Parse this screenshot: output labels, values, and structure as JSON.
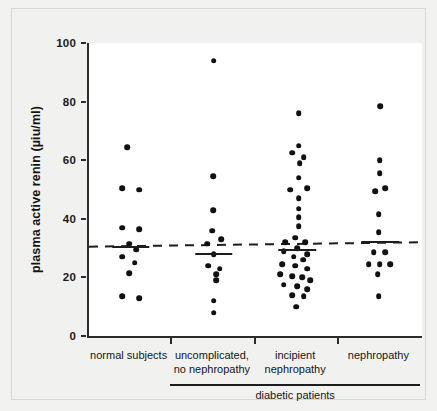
{
  "chart_data": {
    "type": "scatter",
    "title": "",
    "xlabel": "diabetic patients",
    "ylabel": "plasma active renin (µiu/ml)",
    "ylim": [
      0,
      100
    ],
    "yticks": [
      0,
      20,
      40,
      60,
      80,
      100
    ],
    "ytick_labels": [
      "0",
      "20",
      "40",
      "60",
      "80",
      "100"
    ],
    "grid": false,
    "legend": false,
    "categories": [
      "normal subjects",
      "uncomplicated,\nno nephropathy",
      "incipient\nnephropathy",
      "nephropathy"
    ],
    "group_bracket_label": "diabetic patients",
    "group_bracket_categories": [
      "uncomplicated, no nephropathy",
      "incipient nephropathy",
      "nephropathy"
    ],
    "reference_line": {
      "style": "dashed",
      "y_left": 30.5,
      "y_right": 32.0,
      "color": "#1d1d1d"
    },
    "series": [
      {
        "name": "normal subjects",
        "median": 30.5,
        "points": [
          {
            "value": 64.5,
            "offset": -0.04
          },
          {
            "value": 50.5,
            "offset": -0.1
          },
          {
            "value": 50.0,
            "offset": 0.1
          },
          {
            "value": 37.0,
            "offset": -0.1
          },
          {
            "value": 36.5,
            "offset": 0.1
          },
          {
            "value": 31.5,
            "offset": -0.02
          },
          {
            "value": 29.5,
            "offset": 0.07
          },
          {
            "value": 27.0,
            "offset": -0.1
          },
          {
            "value": 25.0,
            "offset": 0.05
          },
          {
            "value": 21.5,
            "offset": -0.02
          },
          {
            "value": 13.5,
            "offset": -0.1
          },
          {
            "value": 13.0,
            "offset": 0.1
          }
        ]
      },
      {
        "name": "uncomplicated, no nephropathy",
        "median": 28.0,
        "points": [
          {
            "value": 94.0,
            "offset": 0.0
          },
          {
            "value": 54.5,
            "offset": -0.01
          },
          {
            "value": 43.0,
            "offset": -0.01
          },
          {
            "value": 36.0,
            "offset": -0.02
          },
          {
            "value": 33.0,
            "offset": 0.09
          },
          {
            "value": 31.5,
            "offset": -0.08
          },
          {
            "value": 28.0,
            "offset": 0.0
          },
          {
            "value": 24.0,
            "offset": -0.07
          },
          {
            "value": 23.0,
            "offset": 0.07
          },
          {
            "value": 21.0,
            "offset": 0.03
          },
          {
            "value": 19.0,
            "offset": 0.03
          },
          {
            "value": 12.0,
            "offset": 0.0
          },
          {
            "value": 8.0,
            "offset": 0.0
          }
        ]
      },
      {
        "name": "incipient nephropathy",
        "median": 29.5,
        "points": [
          {
            "value": 76.0,
            "offset": 0.02
          },
          {
            "value": 65.0,
            "offset": 0.02
          },
          {
            "value": 62.5,
            "offset": -0.06
          },
          {
            "value": 61.0,
            "offset": 0.08
          },
          {
            "value": 59.0,
            "offset": 0.03
          },
          {
            "value": 54.0,
            "offset": 0.02
          },
          {
            "value": 50.0,
            "offset": -0.08
          },
          {
            "value": 50.5,
            "offset": 0.12
          },
          {
            "value": 47.0,
            "offset": 0.02
          },
          {
            "value": 43.5,
            "offset": 0.02
          },
          {
            "value": 40.5,
            "offset": 0.02
          },
          {
            "value": 37.5,
            "offset": 0.02
          },
          {
            "value": 33.5,
            "offset": -0.02
          },
          {
            "value": 32.0,
            "offset": -0.14
          },
          {
            "value": 32.0,
            "offset": 0.1
          },
          {
            "value": 30.0,
            "offset": 0.0
          },
          {
            "value": 29.0,
            "offset": -0.16
          },
          {
            "value": 28.0,
            "offset": 0.12
          },
          {
            "value": 27.0,
            "offset": -0.04
          },
          {
            "value": 26.0,
            "offset": 0.07
          },
          {
            "value": 24.5,
            "offset": -0.18
          },
          {
            "value": 24.0,
            "offset": -0.02
          },
          {
            "value": 23.0,
            "offset": 0.12
          },
          {
            "value": 21.0,
            "offset": -0.2
          },
          {
            "value": 20.5,
            "offset": -0.06
          },
          {
            "value": 20.0,
            "offset": 0.06
          },
          {
            "value": 19.0,
            "offset": 0.16
          },
          {
            "value": 17.5,
            "offset": -0.16
          },
          {
            "value": 17.0,
            "offset": 0.0
          },
          {
            "value": 16.0,
            "offset": 0.12
          },
          {
            "value": 14.0,
            "offset": -0.06
          },
          {
            "value": 13.5,
            "offset": 0.08
          },
          {
            "value": 10.0,
            "offset": -0.01
          }
        ]
      },
      {
        "name": "nephropathy",
        "median": 32.0,
        "points": [
          {
            "value": 78.5,
            "offset": 0.0
          },
          {
            "value": 60.0,
            "offset": -0.01
          },
          {
            "value": 55.5,
            "offset": -0.01
          },
          {
            "value": 49.5,
            "offset": -0.06
          },
          {
            "value": 50.5,
            "offset": 0.06
          },
          {
            "value": 41.5,
            "offset": -0.02
          },
          {
            "value": 35.5,
            "offset": -0.02
          },
          {
            "value": 28.5,
            "offset": -0.08
          },
          {
            "value": 28.5,
            "offset": 0.06
          },
          {
            "value": 24.5,
            "offset": -0.14
          },
          {
            "value": 24.5,
            "offset": -0.01
          },
          {
            "value": 24.5,
            "offset": 0.12
          },
          {
            "value": 21.0,
            "offset": -0.03
          },
          {
            "value": 13.5,
            "offset": -0.02
          }
        ]
      }
    ]
  }
}
